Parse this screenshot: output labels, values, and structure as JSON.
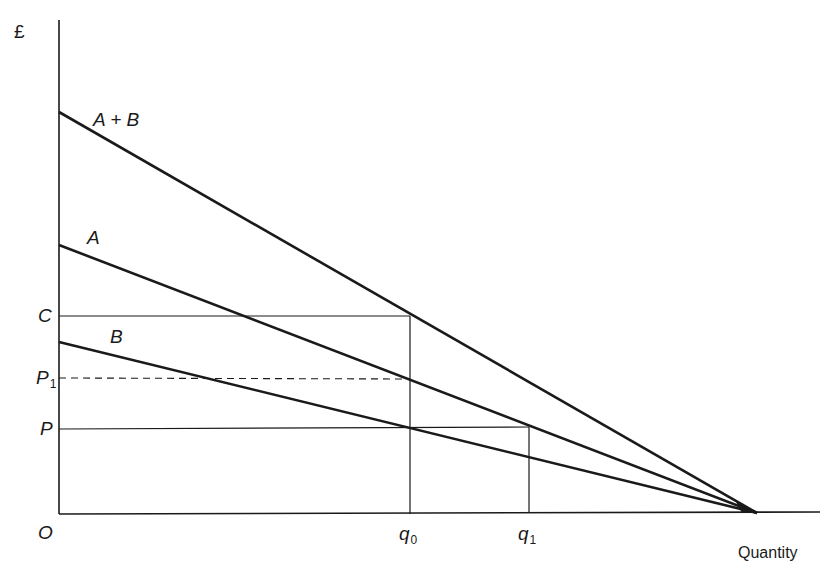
{
  "diagram": {
    "type": "economics-demand-diagram",
    "y_axis": {
      "label": "£"
    },
    "x_axis": {
      "label": "Quantity"
    },
    "origin": {
      "label": "O"
    },
    "curves": [
      {
        "id": "A_plus_B",
        "label": "A + B",
        "description": "Aggregate (vertically summed) demand curve"
      },
      {
        "id": "A",
        "label": "A",
        "description": "Demand curve A"
      },
      {
        "id": "B",
        "label": "B",
        "description": "Demand curve B"
      }
    ],
    "price_levels": [
      {
        "id": "C",
        "label": "C",
        "line": "solid"
      },
      {
        "id": "P1",
        "label": "P",
        "subscript": "1",
        "line": "dashed"
      },
      {
        "id": "P",
        "label": "P",
        "line": "solid"
      }
    ],
    "quantities": [
      {
        "id": "q0",
        "label": "q",
        "subscript": "0"
      },
      {
        "id": "q1",
        "label": "q",
        "subscript": "1"
      }
    ]
  },
  "colors": {
    "line": "#1a1a1a",
    "background": "#ffffff"
  }
}
